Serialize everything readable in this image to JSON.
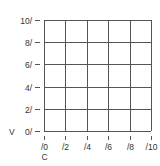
{
  "chart_data": {
    "type": "line",
    "title": "",
    "xlabel": "C",
    "ylabel": "V",
    "x_ticks": [
      "/0",
      "/2",
      "/4",
      "/6",
      "/8",
      "/10"
    ],
    "y_ticks": [
      "0/",
      "2/",
      "4/",
      "6/",
      "8/",
      "10/"
    ],
    "xlim": [
      0,
      10
    ],
    "ylim": [
      0,
      10
    ],
    "grid": true,
    "legend": null,
    "series": []
  },
  "layout": {
    "plot_left": 44,
    "plot_right": 151,
    "plot_top": 20,
    "plot_bottom": 131,
    "grid_color": "#555555",
    "text_color": "#333333"
  }
}
